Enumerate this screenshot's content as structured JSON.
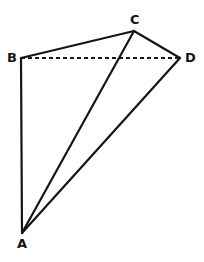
{
  "figure": {
    "type": "geometry-diagram",
    "width": 204,
    "height": 262,
    "background_color": "#ffffff",
    "stroke_color": "#151515",
    "stroke_width": 2,
    "vertices": [
      {
        "id": "A",
        "label": "A",
        "x": 22,
        "y": 233,
        "label_x": 17,
        "label_y": 237
      },
      {
        "id": "B",
        "label": "B",
        "x": 21,
        "y": 58,
        "label_x": 7,
        "label_y": 51
      },
      {
        "id": "C",
        "label": "C",
        "x": 134,
        "y": 31,
        "label_x": 130,
        "label_y": 13
      },
      {
        "id": "D",
        "label": "D",
        "x": 180,
        "y": 58,
        "label_x": 185,
        "label_y": 51
      }
    ],
    "edges": [
      {
        "id": "AB",
        "from": "A",
        "to": "B",
        "style": "solid",
        "x1": 22,
        "y1": 233,
        "x2": 21,
        "y2": 58
      },
      {
        "id": "BC",
        "from": "B",
        "to": "C",
        "style": "solid",
        "x1": 21,
        "y1": 58,
        "x2": 134,
        "y2": 31
      },
      {
        "id": "CD",
        "from": "C",
        "to": "D",
        "style": "solid",
        "x1": 134,
        "y1": 31,
        "x2": 180,
        "y2": 58
      },
      {
        "id": "DA",
        "from": "D",
        "to": "A",
        "style": "solid",
        "x1": 180,
        "y1": 58,
        "x2": 22,
        "y2": 233
      },
      {
        "id": "AC",
        "from": "A",
        "to": "C",
        "style": "solid",
        "x1": 22,
        "y1": 233,
        "x2": 134,
        "y2": 31
      },
      {
        "id": "BD",
        "from": "B",
        "to": "D",
        "style": "dashed",
        "x1": 21,
        "y1": 58,
        "x2": 180,
        "y2": 58,
        "dash_pattern": "4,3"
      }
    ]
  }
}
